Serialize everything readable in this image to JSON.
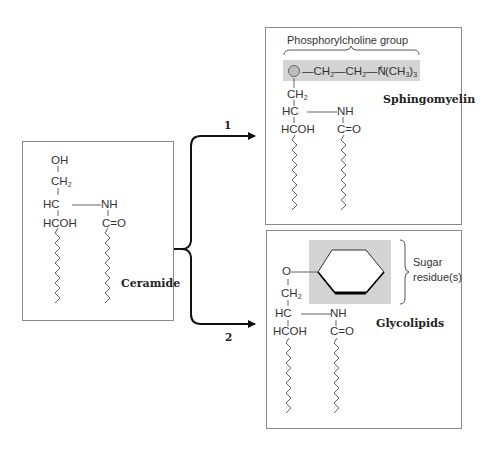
{
  "ceramide": {
    "label": "Ceramide",
    "atoms": {
      "oh": "OH",
      "ch2": "CH",
      "ch2_sub": "2",
      "hc": "HC",
      "nh": "NH",
      "hcoh": "HCOH",
      "co": "C=O"
    }
  },
  "pathways": [
    {
      "number": "1",
      "target": "Sphingomyelin"
    },
    {
      "number": "2",
      "target": "Glycolipids"
    }
  ],
  "sphingomyelin": {
    "label": "Sphingomyelin",
    "group_label": "Phosphorylcholine group",
    "phosphate_symbol": "P",
    "chain": {
      "ch2a": "CH",
      "ch2a_sub": "2",
      "ch2b": "CH",
      "ch2b_sub": "2",
      "n": "N",
      "n_charge": "+",
      "methyl": "(CH",
      "methyl_sub": "3",
      "methyl_close": ")",
      "methyl_count": "3"
    },
    "atoms": {
      "ch2": "CH",
      "ch2_sub": "2",
      "hc": "HC",
      "nh": "NH",
      "hcoh": "HCOH",
      "co": "C=O"
    },
    "highlight_color": "#d4d4d4"
  },
  "glycolipids": {
    "label": "Glycolipids",
    "sugar_label_line1": "Sugar",
    "sugar_label_line2": "residue(s)",
    "atoms": {
      "o": "O",
      "ch2": "CH",
      "ch2_sub": "2",
      "hc": "HC",
      "nh": "NH",
      "hcoh": "HCOH",
      "co": "C=O"
    },
    "highlight_color": "#d4d4d4"
  }
}
